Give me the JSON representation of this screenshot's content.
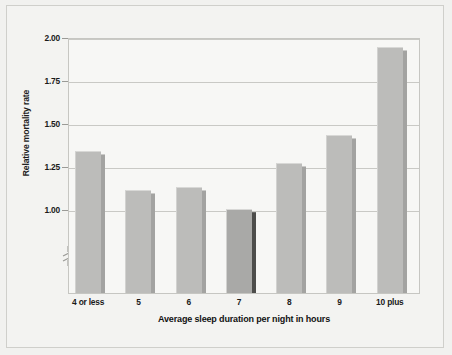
{
  "chart_data": {
    "type": "bar",
    "title": "",
    "xlabel": "Average sleep duration per night in hours",
    "ylabel": "Relative mortality rate",
    "categories": [
      "4 or less",
      "5",
      "6",
      "7",
      "8",
      "9",
      "10 plus"
    ],
    "values": [
      1.34,
      1.11,
      1.13,
      1.0,
      1.27,
      1.43,
      1.94
    ],
    "ylim": [
      0.85,
      2.0
    ],
    "yticks": [
      "1.00",
      "1.25",
      "1.50",
      "1.75",
      "2.00"
    ],
    "ytick_values": [
      1.0,
      1.25,
      1.5,
      1.75,
      2.0
    ],
    "grid": true,
    "legend": "none",
    "axis_break": true,
    "axis_break_note": "y-axis broken below 1.00",
    "highlight_index": 3,
    "colors": {
      "bar_fill": "#bcbcba",
      "bar_fill_highlight": "#a9a9a7",
      "bar_side": "#a3a3a1",
      "bar_side_highlight": "#4d4d4b",
      "gridline": "#c9c9c5",
      "plot_background": "#f7f7f5",
      "figure_background": "#f1f1ef",
      "text": "#1a1a1a"
    }
  }
}
